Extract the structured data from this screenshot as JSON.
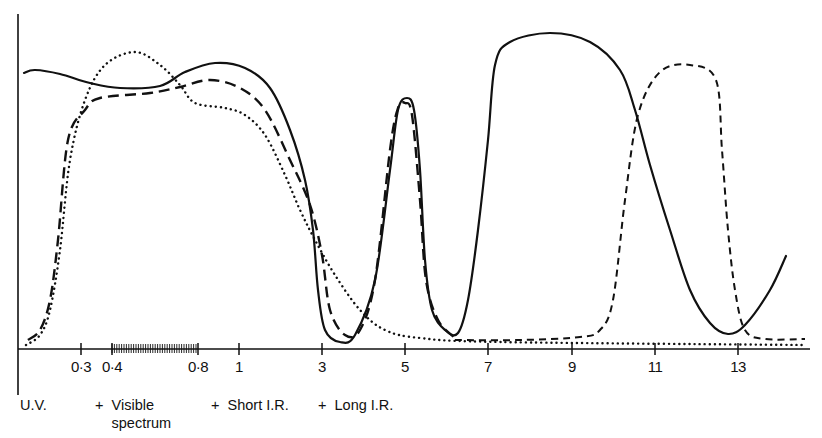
{
  "chart_data": {
    "type": "line",
    "title": "",
    "xlabel": "Wavelength (µm, non-linear scale)",
    "ylabel": "",
    "x_ticks": [
      "0·3",
      "0·4",
      "0·8",
      "1",
      "3",
      "5",
      "7",
      "9",
      "11",
      "13"
    ],
    "x_tick_px": [
      81,
      112,
      198,
      239,
      322,
      405,
      488,
      572,
      655,
      738
    ],
    "visible_band": {
      "from": "0·4",
      "to": "0·8",
      "style": "hatched"
    },
    "bands": [
      {
        "label": "U.V.",
        "prefix": ""
      },
      {
        "label": "Visible spectrum",
        "prefix": "+"
      },
      {
        "label": "Short I.R.",
        "prefix": "+"
      },
      {
        "label": "Long I.R.",
        "prefix": "+"
      }
    ],
    "grid": false,
    "legend": null,
    "series": [
      {
        "name": "solid",
        "style": "solid",
        "points_px": [
          [
            24,
            73
          ],
          [
            35,
            70
          ],
          [
            60,
            74
          ],
          [
            90,
            83
          ],
          [
            120,
            88
          ],
          [
            160,
            86
          ],
          [
            185,
            72
          ],
          [
            215,
            63
          ],
          [
            245,
            68
          ],
          [
            270,
            88
          ],
          [
            290,
            130
          ],
          [
            305,
            180
          ],
          [
            313,
            230
          ],
          [
            318,
            290
          ],
          [
            325,
            330
          ],
          [
            340,
            342
          ],
          [
            355,
            335
          ],
          [
            375,
            280
          ],
          [
            390,
            170
          ],
          [
            398,
            110
          ],
          [
            407,
            98
          ],
          [
            414,
            110
          ],
          [
            420,
            170
          ],
          [
            425,
            260
          ],
          [
            432,
            310
          ],
          [
            445,
            330
          ],
          [
            458,
            333
          ],
          [
            468,
            300
          ],
          [
            478,
            230
          ],
          [
            488,
            140
          ],
          [
            495,
            65
          ],
          [
            510,
            42
          ],
          [
            550,
            33
          ],
          [
            590,
            42
          ],
          [
            620,
            70
          ],
          [
            635,
            110
          ],
          [
            650,
            165
          ],
          [
            670,
            230
          ],
          [
            690,
            290
          ],
          [
            710,
            323
          ],
          [
            728,
            334
          ],
          [
            745,
            325
          ],
          [
            770,
            290
          ],
          [
            786,
            256
          ]
        ],
        "y_relative": "solid curve: ~0.85 in UV, 0.88 near 1µm, trough ~0.02 at 3.5µm, peak 0.82 at 5µm, trough 0.04 at 6µm, max 0.97 at 8µm, trough 0.04 at 13µm, rising to 0.30 at 14µm"
      },
      {
        "name": "long-dashed",
        "style": "long-dash",
        "points_px": [
          [
            28,
            340
          ],
          [
            40,
            330
          ],
          [
            50,
            300
          ],
          [
            58,
            240
          ],
          [
            68,
            140
          ],
          [
            85,
            110
          ],
          [
            100,
            98
          ],
          [
            150,
            93
          ],
          [
            180,
            87
          ],
          [
            210,
            80
          ],
          [
            240,
            88
          ],
          [
            265,
            110
          ],
          [
            290,
            160
          ],
          [
            310,
            205
          ],
          [
            322,
            255
          ],
          [
            330,
            310
          ],
          [
            345,
            335
          ],
          [
            360,
            330
          ],
          [
            375,
            280
          ],
          [
            390,
            150
          ],
          [
            398,
            108
          ],
          [
            405,
            103
          ],
          [
            412,
            115
          ],
          [
            420,
            200
          ],
          [
            426,
            280
          ],
          [
            438,
            320
          ],
          [
            455,
            338
          ]
        ]
      },
      {
        "name": "short-dashed",
        "style": "short-dash",
        "points_px": [
          [
            455,
            340
          ],
          [
            520,
            340
          ],
          [
            580,
            337
          ],
          [
            600,
            330
          ],
          [
            613,
            300
          ],
          [
            625,
            200
          ],
          [
            638,
            115
          ],
          [
            660,
            72
          ],
          [
            690,
            65
          ],
          [
            716,
            80
          ],
          [
            722,
            150
          ],
          [
            728,
            230
          ],
          [
            735,
            290
          ],
          [
            745,
            330
          ],
          [
            765,
            339
          ],
          [
            805,
            339
          ]
        ]
      },
      {
        "name": "dotted",
        "style": "dotted",
        "points_px": [
          [
            26,
            345
          ],
          [
            40,
            335
          ],
          [
            50,
            310
          ],
          [
            60,
            250
          ],
          [
            70,
            160
          ],
          [
            85,
            100
          ],
          [
            105,
            65
          ],
          [
            135,
            52
          ],
          [
            160,
            65
          ],
          [
            180,
            85
          ],
          [
            195,
            103
          ],
          [
            225,
            108
          ],
          [
            245,
            115
          ],
          [
            265,
            135
          ],
          [
            285,
            175
          ],
          [
            300,
            210
          ],
          [
            315,
            240
          ],
          [
            335,
            275
          ],
          [
            360,
            310
          ],
          [
            385,
            330
          ],
          [
            420,
            338
          ],
          [
            500,
            342
          ],
          [
            805,
            345
          ]
        ]
      }
    ],
    "axis": {
      "x_line_y_px": 349,
      "y_line_x_px": 18,
      "y_top_px": 14,
      "y_bottom_px": 395
    }
  }
}
